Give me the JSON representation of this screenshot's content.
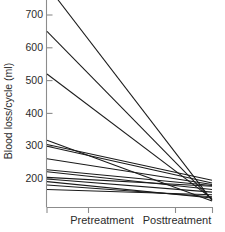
{
  "chart_data": {
    "type": "line",
    "title": "",
    "subtitle": "",
    "xlabel": "",
    "ylabel": "Blood loss/cycle (ml)",
    "categories": [
      "Pretreatment",
      "Posttreatment"
    ],
    "x": [
      0,
      1
    ],
    "ylim": [
      130,
      760
    ],
    "yticks": [
      200,
      300,
      400,
      500,
      600,
      700
    ],
    "ytick_labels": [
      "200",
      "300",
      "400",
      "500",
      "600",
      "700"
    ],
    "grid": false,
    "legend": null,
    "annotations": [],
    "series": [
      {
        "name": "subject-1",
        "values": [
          790,
          135
        ]
      },
      {
        "name": "subject-2",
        "values": [
          650,
          137
        ]
      },
      {
        "name": "subject-3",
        "values": [
          520,
          140
        ]
      },
      {
        "name": "subject-4",
        "values": [
          318,
          133
        ]
      },
      {
        "name": "subject-5",
        "values": [
          305,
          196
        ]
      },
      {
        "name": "subject-6",
        "values": [
          300,
          188
        ]
      },
      {
        "name": "subject-7",
        "values": [
          262,
          183
        ]
      },
      {
        "name": "subject-8",
        "values": [
          228,
          180
        ]
      },
      {
        "name": "subject-9",
        "values": [
          222,
          168
        ]
      },
      {
        "name": "subject-10",
        "values": [
          205,
          178
        ]
      },
      {
        "name": "subject-11",
        "values": [
          200,
          160
        ]
      },
      {
        "name": "subject-12",
        "values": [
          192,
          142
        ]
      },
      {
        "name": "subject-13",
        "values": [
          182,
          146
        ]
      },
      {
        "name": "subject-14",
        "values": [
          168,
          152
        ]
      }
    ]
  },
  "axes": {
    "y_axis_label": "Blood loss/cycle (ml)",
    "x_tick_labels": [
      "Pretreatment",
      "Posttreatment"
    ]
  }
}
